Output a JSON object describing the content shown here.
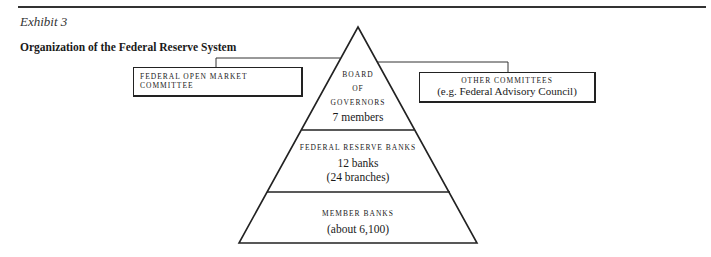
{
  "header": {
    "exhibit_label": "Exhibit 3",
    "title": "Organization of the Federal Reserve System"
  },
  "side_boxes": {
    "fomc": {
      "label": "FEDERAL OPEN MARKET COMMITTEE"
    },
    "other": {
      "label": "OTHER COMMITTEES",
      "sublabel": "(e.g. Federal Advisory Council)"
    }
  },
  "pyramid": {
    "tiers": [
      {
        "lines": [
          "BOARD",
          "OF",
          "GOVERNORS"
        ],
        "detail": "7 members"
      },
      {
        "label": "FEDERAL RESERVE BANKS",
        "detail": "12 banks",
        "detail2": "(24 branches)"
      },
      {
        "label": "MEMBER BANKS",
        "detail": "(about 6,100)"
      }
    ]
  },
  "colors": {
    "line": "#222222",
    "background": "#ffffff"
  }
}
